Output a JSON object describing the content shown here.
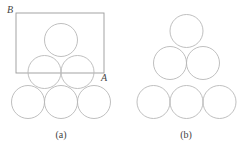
{
  "figure": {
    "panels": [
      {
        "id": "a",
        "caption": "(a)",
        "caption_pos": [
          61,
          138
        ],
        "rectangle": {
          "x": 16,
          "y": 13,
          "width": 88,
          "height": 60,
          "corner_labels": [
            {
              "text": "B",
              "x": 7,
              "y": 13
            },
            {
              "text": "A",
              "x": 101,
              "y": 81
            }
          ]
        },
        "circles": [
          {
            "cx": 61,
            "cy": 40,
            "r": 16.5
          },
          {
            "cx": 44.5,
            "cy": 72,
            "r": 16.5
          },
          {
            "cx": 77.5,
            "cy": 72,
            "r": 16.5
          },
          {
            "cx": 28,
            "cy": 102,
            "r": 16.5
          },
          {
            "cx": 61,
            "cy": 102,
            "r": 16.5
          },
          {
            "cx": 94,
            "cy": 102,
            "r": 16.5
          }
        ]
      },
      {
        "id": "b",
        "caption": "(b)",
        "caption_pos": [
          186,
          138
        ],
        "circles": [
          {
            "cx": 186.5,
            "cy": 31,
            "r": 16.5
          },
          {
            "cx": 170,
            "cy": 63,
            "r": 16.5
          },
          {
            "cx": 203,
            "cy": 63,
            "r": 16.5
          },
          {
            "cx": 153.5,
            "cy": 102,
            "r": 16.5
          },
          {
            "cx": 186.5,
            "cy": 102,
            "r": 16.5
          },
          {
            "cx": 219.5,
            "cy": 102,
            "r": 16.5
          }
        ]
      }
    ],
    "colors": {
      "circle_stroke": "#b8b8b8",
      "rect_stroke": "#9a9a9a",
      "text": "#444444",
      "background": "#ffffff"
    }
  }
}
